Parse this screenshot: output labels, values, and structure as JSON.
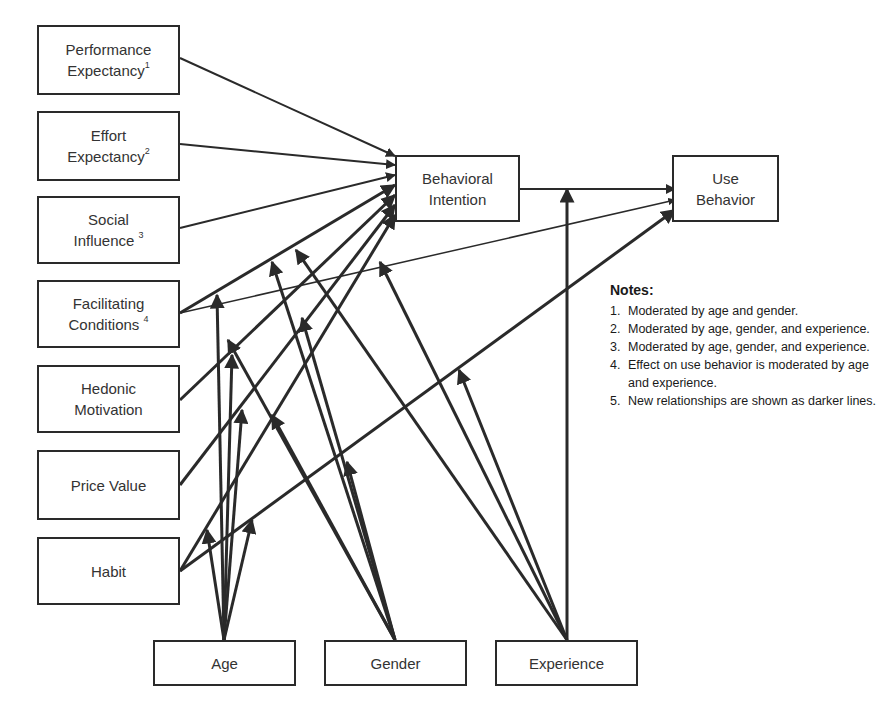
{
  "boxes": {
    "performance_expectancy": {
      "line1": "Performance",
      "line2": "Expectancy",
      "sup": "1"
    },
    "effort_expectancy": {
      "line1": "Effort",
      "line2": "Expectancy",
      "sup": "2"
    },
    "social_influence": {
      "line1": "Social",
      "line2": "Influence ",
      "sup": "3"
    },
    "facilitating_conditions": {
      "line1": "Facilitating",
      "line2": "Conditions ",
      "sup": "4"
    },
    "hedonic_motivation": {
      "line1": "Hedonic",
      "line2": "Motivation"
    },
    "price_value": {
      "line1": "Price Value"
    },
    "habit": {
      "line1": "Habit"
    },
    "behavioral_intention": {
      "line1": "Behavioral",
      "line2": "Intention"
    },
    "use_behavior": {
      "line1": "Use",
      "line2": "Behavior"
    },
    "age": {
      "line1": "Age"
    },
    "gender": {
      "line1": "Gender"
    },
    "experience": {
      "line1": "Experience"
    }
  },
  "notes": {
    "title": "Notes:",
    "items": [
      {
        "num": "1.",
        "text": "Moderated by age and gender."
      },
      {
        "num": "2.",
        "text": "Moderated by age, gender, and experience."
      },
      {
        "num": "3.",
        "text": "Moderated by age, gender, and experience."
      },
      {
        "num": "4.",
        "text": "Effect on use behavior is moderated by age and experience."
      },
      {
        "num": "5.",
        "text": "New relationships are shown as darker lines."
      }
    ]
  },
  "edges": [
    {
      "x1": 180,
      "y1": 58,
      "x2": 395,
      "y2": 156,
      "w": 2
    },
    {
      "x1": 180,
      "y1": 144,
      "x2": 395,
      "y2": 165,
      "w": 2
    },
    {
      "x1": 180,
      "y1": 228,
      "x2": 395,
      "y2": 175,
      "w": 2
    },
    {
      "x1": 180,
      "y1": 313,
      "x2": 395,
      "y2": 185,
      "w": 3
    },
    {
      "x1": 180,
      "y1": 313,
      "x2": 675,
      "y2": 200,
      "w": 1.5
    },
    {
      "x1": 180,
      "y1": 400,
      "x2": 395,
      "y2": 195,
      "w": 3
    },
    {
      "x1": 180,
      "y1": 485,
      "x2": 395,
      "y2": 205,
      "w": 3
    },
    {
      "x1": 180,
      "y1": 571,
      "x2": 395,
      "y2": 215,
      "w": 3
    },
    {
      "x1": 180,
      "y1": 571,
      "x2": 675,
      "y2": 210,
      "w": 3
    },
    {
      "x1": 520,
      "y1": 189,
      "x2": 675,
      "y2": 189,
      "w": 2
    },
    {
      "x1": 567,
      "y1": 640,
      "x2": 567,
      "y2": 189,
      "w": 3
    },
    {
      "x1": 224,
      "y1": 640,
      "x2": 217,
      "y2": 295,
      "w": 3
    },
    {
      "x1": 224,
      "y1": 640,
      "x2": 232,
      "y2": 355,
      "w": 3
    },
    {
      "x1": 224,
      "y1": 640,
      "x2": 242,
      "y2": 410,
      "w": 3
    },
    {
      "x1": 224,
      "y1": 640,
      "x2": 207,
      "y2": 530,
      "w": 3
    },
    {
      "x1": 224,
      "y1": 640,
      "x2": 252,
      "y2": 520,
      "w": 3
    },
    {
      "x1": 395,
      "y1": 640,
      "x2": 272,
      "y2": 262,
      "w": 3
    },
    {
      "x1": 395,
      "y1": 640,
      "x2": 302,
      "y2": 318,
      "w": 3
    },
    {
      "x1": 395,
      "y1": 640,
      "x2": 272,
      "y2": 415,
      "w": 3
    },
    {
      "x1": 395,
      "y1": 640,
      "x2": 347,
      "y2": 462,
      "w": 3
    },
    {
      "x1": 395,
      "y1": 640,
      "x2": 228,
      "y2": 340,
      "w": 3
    },
    {
      "x1": 567,
      "y1": 640,
      "x2": 296,
      "y2": 250,
      "w": 3
    },
    {
      "x1": 567,
      "y1": 640,
      "x2": 380,
      "y2": 262,
      "w": 3
    },
    {
      "x1": 567,
      "y1": 640,
      "x2": 459,
      "y2": 370,
      "w": 3
    }
  ]
}
